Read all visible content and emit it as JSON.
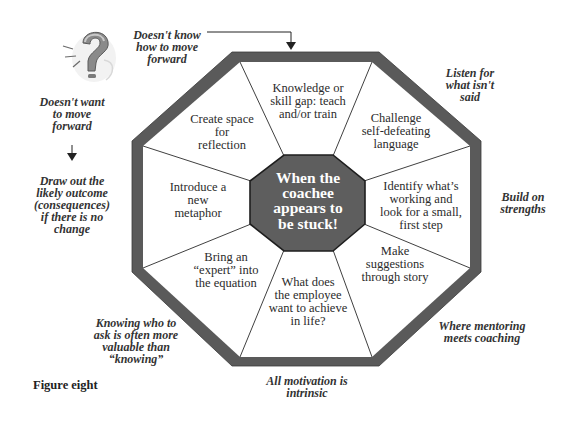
{
  "diagram": {
    "title": "When the coachee appears to be stuck!",
    "center": {
      "lines": [
        "When the",
        "coachee",
        "appears to",
        "be stuck!"
      ],
      "fill": "#5e5e5e"
    },
    "frame_color": "#5a5a5a",
    "segments": [
      {
        "id": "knowledge-gap",
        "lines": [
          "Knowledge or",
          "skill gap: teach",
          "and/or train"
        ]
      },
      {
        "id": "challenge-language",
        "lines": [
          "Challenge",
          "self-defeating",
          "language"
        ]
      },
      {
        "id": "identify-working",
        "lines": [
          "Identify what’s",
          "working and",
          "look for a small,",
          "first step"
        ]
      },
      {
        "id": "suggestions-story",
        "lines": [
          "Make",
          "suggestions",
          "through story"
        ]
      },
      {
        "id": "employee-life",
        "lines": [
          "What does",
          "the employee",
          "want to achieve",
          "in life?"
        ]
      },
      {
        "id": "bring-expert",
        "lines": [
          "Bring an",
          "“expert” into",
          "the equation"
        ]
      },
      {
        "id": "new-metaphor",
        "lines": [
          "Introduce a",
          "new",
          "metaphor"
        ]
      },
      {
        "id": "create-space",
        "lines": [
          "Create space",
          "for",
          "reflection"
        ]
      }
    ],
    "outer_notes": [
      {
        "id": "doesnt-know",
        "lines": [
          "Doesn't know",
          "how to move",
          "forward"
        ]
      },
      {
        "id": "listen-for",
        "lines": [
          "Listen for",
          "what isn't",
          "said"
        ]
      },
      {
        "id": "build-on",
        "lines": [
          "Build on",
          "strengths"
        ]
      },
      {
        "id": "mentoring",
        "lines": [
          "Where mentoring",
          "meets coaching"
        ]
      },
      {
        "id": "motivation",
        "lines": [
          "All motivation is",
          "intrinsic"
        ]
      },
      {
        "id": "knowing-who",
        "lines": [
          "Knowing who to",
          "ask is often more",
          "valuable than",
          "“knowing”"
        ]
      },
      {
        "id": "draw-out",
        "lines": [
          "Draw out the",
          "likely outcome",
          "(consequences)",
          "if there is no",
          "change"
        ]
      },
      {
        "id": "doesnt-want",
        "lines": [
          "Doesn't want",
          "to move",
          "forward"
        ]
      }
    ],
    "caption": "Figure eight",
    "icons": {
      "question_mark": "question-mark-icon"
    }
  }
}
